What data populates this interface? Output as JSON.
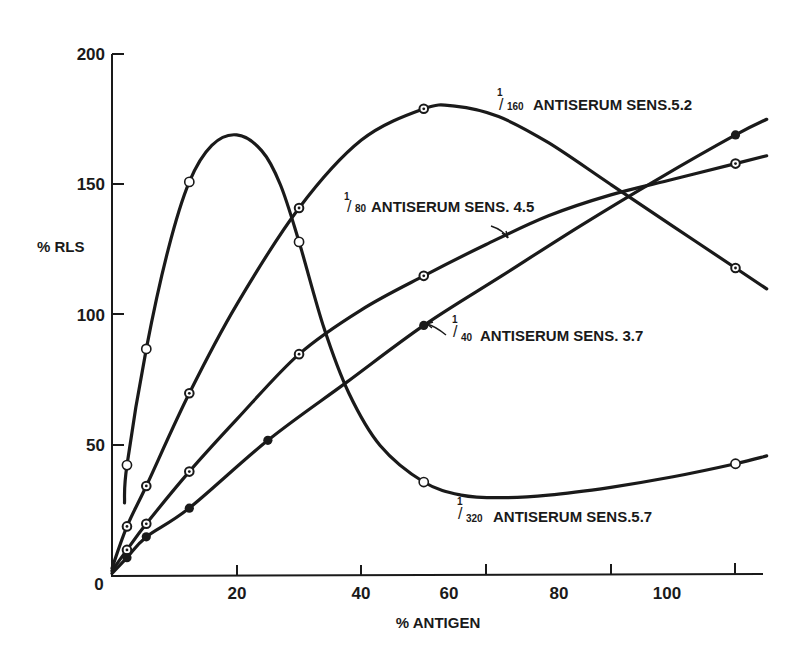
{
  "chart_data": {
    "type": "line",
    "title": "",
    "xlabel": "% ANTIGEN",
    "ylabel": "% RLS",
    "xlim": [
      0,
      105
    ],
    "ylim": [
      0,
      200
    ],
    "x_ticks": [
      20,
      40,
      60,
      80,
      100
    ],
    "y_ticks": [
      0,
      50,
      100,
      150,
      200
    ],
    "origin_label": "0",
    "grid": false,
    "legend": "inline labels",
    "colors": {
      "ink": "#1a1a1a",
      "background": "#ffffff"
    },
    "series": [
      {
        "name": "1/320 ANTISERUM SENS. 5.7",
        "dilution_numerator": "1",
        "dilution_denominator": "320",
        "label_text": "ANTISERUM SENS.5.7",
        "marker": "open-circle",
        "points": [
          [
            2.4,
            42.5
          ],
          [
            5.5,
            87
          ],
          [
            12.4,
            151
          ],
          [
            30,
            128
          ],
          [
            50,
            36
          ],
          [
            100,
            43
          ]
        ],
        "curve": [
          [
            2,
            28
          ],
          [
            2.4,
            42.5
          ],
          [
            5.5,
            87
          ],
          [
            9,
            125
          ],
          [
            12.4,
            151
          ],
          [
            16,
            165
          ],
          [
            20,
            169
          ],
          [
            24,
            163
          ],
          [
            27,
            150
          ],
          [
            30,
            128
          ],
          [
            34,
            95
          ],
          [
            38,
            70
          ],
          [
            43,
            50
          ],
          [
            50,
            36
          ],
          [
            56,
            31
          ],
          [
            62,
            30
          ],
          [
            70,
            31
          ],
          [
            80,
            34
          ],
          [
            90,
            38
          ],
          [
            100,
            43
          ],
          [
            105,
            46
          ]
        ]
      },
      {
        "name": "1/160 ANTISERUM SENS. 5.2",
        "dilution_numerator": "1",
        "dilution_denominator": "160",
        "label_text": "ANTISERUM SENS.5.2",
        "marker": "dotted-circle",
        "points": [
          [
            2.4,
            19
          ],
          [
            5.5,
            34.5
          ],
          [
            12.4,
            70
          ],
          [
            30,
            141
          ],
          [
            50,
            179
          ],
          [
            100,
            118
          ]
        ],
        "curve": [
          [
            0,
            3
          ],
          [
            2.4,
            19
          ],
          [
            5.5,
            34.5
          ],
          [
            12.4,
            70
          ],
          [
            20,
            104
          ],
          [
            30,
            141
          ],
          [
            40,
            167
          ],
          [
            50,
            179
          ],
          [
            55,
            180
          ],
          [
            62,
            176
          ],
          [
            70,
            166
          ],
          [
            80,
            150
          ],
          [
            90,
            134
          ],
          [
            100,
            118
          ],
          [
            105,
            110
          ]
        ]
      },
      {
        "name": "1/80 ANTISERUM SENS. 4.5",
        "dilution_numerator": "1",
        "dilution_denominator": "80",
        "label_text": "ANTISERUM SENS. 4.5",
        "marker": "dotted-circle",
        "points": [
          [
            2.4,
            10
          ],
          [
            5.5,
            20
          ],
          [
            12.4,
            40
          ],
          [
            30,
            85
          ],
          [
            50,
            115
          ],
          [
            100,
            158
          ]
        ],
        "curve": [
          [
            0,
            2
          ],
          [
            2.4,
            10
          ],
          [
            5.5,
            20
          ],
          [
            12.4,
            40
          ],
          [
            20,
            60
          ],
          [
            30,
            85
          ],
          [
            40,
            102
          ],
          [
            50,
            115
          ],
          [
            60,
            127
          ],
          [
            70,
            138
          ],
          [
            80,
            146
          ],
          [
            90,
            152
          ],
          [
            100,
            158
          ],
          [
            105,
            161
          ]
        ]
      },
      {
        "name": "1/40 ANTISERUM SENS. 3.7",
        "dilution_numerator": "1",
        "dilution_denominator": "40",
        "label_text": "ANTISERUM SENS. 3.7",
        "marker": "filled-circle",
        "points": [
          [
            2.4,
            7
          ],
          [
            5.5,
            15
          ],
          [
            12.4,
            26
          ],
          [
            25,
            52
          ],
          [
            50,
            96
          ],
          [
            100,
            169
          ]
        ],
        "curve": [
          [
            0,
            1
          ],
          [
            2.4,
            7
          ],
          [
            5.5,
            15
          ],
          [
            12.4,
            26
          ],
          [
            25,
            52
          ],
          [
            37.5,
            74
          ],
          [
            50,
            96
          ],
          [
            62.5,
            115
          ],
          [
            75,
            134
          ],
          [
            87.5,
            152
          ],
          [
            100,
            169
          ],
          [
            105,
            175
          ]
        ]
      }
    ]
  },
  "labels": {
    "y_axis_title": "% RLS",
    "x_axis_title": "% ANTIGEN",
    "origin": "0",
    "x_tick_20": "20",
    "x_tick_40": "40",
    "x_tick_60": "60",
    "x_tick_80": "80",
    "x_tick_100": "100",
    "y_tick_50": "50",
    "y_tick_100": "100",
    "y_tick_150": "150",
    "y_tick_200": "200",
    "s160_num": "1",
    "s160_den": "160",
    "s160_text": "ANTISERUM SENS.5.2",
    "s80_num": "1",
    "s80_den": "80",
    "s80_text": "ANTISERUM SENS. 4.5",
    "s40_num": "1",
    "s40_den": "40",
    "s40_text": "ANTISERUM SENS. 3.7",
    "s320_num": "1",
    "s320_den": "320",
    "s320_text": "ANTISERUM SENS.5.7"
  }
}
